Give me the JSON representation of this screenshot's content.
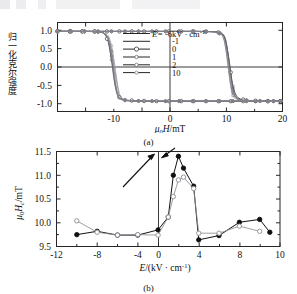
{
  "figure": {
    "panel_a_caption": "(a)",
    "panel_b_caption": "(b)"
  },
  "panel_a": {
    "ylabel_cn": "归一化克尔强度",
    "xlabel": "μ0H/mT",
    "xlabel_parts": {
      "mu": "μ",
      "zero": "0",
      "H": "H",
      "unit": "/mT"
    },
    "xticks": [
      "-10",
      "0",
      "10",
      "20"
    ],
    "yticks": [
      "1.0",
      "0.5",
      "0.0",
      "-0.5",
      "-1.0"
    ],
    "xlim": [
      -20,
      20
    ],
    "ylim": [
      -1.25,
      1.25
    ],
    "legend": {
      "title_prefix": "E=",
      "title_value": "-6kV · cm",
      "title_exp": "-1",
      "entries": [
        "-1",
        "0",
        "1",
        "2",
        "10"
      ]
    }
  },
  "panel_b": {
    "ylabel": "μ0Hc/mT",
    "ylabel_parts": {
      "mu": "μ",
      "zero": "0",
      "H": "H",
      "c": "c",
      "unit": "/mT"
    },
    "xlabel": "E/(kV · cm-1)",
    "xlabel_parts": {
      "E": "E",
      "open": "/(kV · cm",
      "exp": "-1",
      "close": ")"
    },
    "xticks": [
      "-12",
      "-8",
      "-4",
      "0",
      "4",
      "8",
      "10"
    ],
    "yticks": [
      "11.5",
      "11.0",
      "10.5",
      "10.0",
      "9.5"
    ],
    "xlim": [
      -12,
      10
    ],
    "ylim": [
      9.5,
      11.5
    ]
  },
  "chart_data": [
    {
      "type": "line",
      "panel": "a",
      "title": "",
      "xlabel": "μ0H/mT",
      "ylabel": "归一化克尔强度",
      "xlim": [
        -20,
        20
      ],
      "ylim": [
        -1.25,
        1.25
      ],
      "xticks": [
        -10,
        0,
        10,
        20
      ],
      "yticks": [
        -1.0,
        -0.5,
        0.0,
        0.5,
        1.0
      ],
      "grid": false,
      "legend_position": "inside-upper-right",
      "legend_title": "E=-6kV · cm-1",
      "series": [
        {
          "name": "-6",
          "marker": "line",
          "branch_down_x": [
            -20,
            -18,
            -16,
            -14,
            -13,
            -12,
            -11.5,
            -11,
            -10.5,
            -10,
            -9.6,
            -9.2,
            -9,
            -8.6,
            -8,
            -7,
            -5,
            -2,
            0,
            5,
            10,
            14,
            20
          ],
          "branch_down_y": [
            1.0,
            1.0,
            1.0,
            1.0,
            0.99,
            0.97,
            0.92,
            0.8,
            0.5,
            0.1,
            -0.3,
            -0.65,
            -0.8,
            -0.9,
            -0.94,
            -0.96,
            -0.96,
            -0.96,
            -0.96,
            -0.96,
            -0.96,
            -0.96,
            -0.96
          ],
          "branch_up_x": [
            20,
            16,
            14,
            13,
            12,
            11.5,
            11,
            10.6,
            10.2,
            10,
            9.6,
            9,
            8,
            6,
            3,
            0,
            -5,
            -10,
            -20
          ],
          "branch_up_y": [
            -0.96,
            -0.96,
            -0.95,
            -0.93,
            -0.88,
            -0.75,
            -0.4,
            0.0,
            0.45,
            0.7,
            0.88,
            0.95,
            0.99,
            1.0,
            1.0,
            1.0,
            1.0,
            1.0,
            1.0
          ]
        },
        {
          "name": "-1",
          "marker": "line",
          "branch_down_x": [
            -20,
            -17,
            -15,
            -13,
            -12,
            -11,
            -10.4,
            -10,
            -9.6,
            -9.2,
            -8.8,
            -8,
            -6,
            -2,
            0,
            6,
            12,
            20
          ],
          "branch_down_y": [
            1.0,
            1.0,
            1.0,
            0.99,
            0.96,
            0.88,
            0.6,
            0.25,
            -0.2,
            -0.6,
            -0.82,
            -0.92,
            -0.95,
            -0.96,
            -0.96,
            -0.96,
            -0.96,
            -0.96
          ],
          "branch_up_x": [
            20,
            16,
            13,
            12,
            11.4,
            11,
            10.6,
            10.2,
            9.8,
            9.4,
            8.6,
            6,
            2,
            0,
            -6,
            -14,
            -20
          ],
          "branch_up_y": [
            -0.96,
            -0.95,
            -0.93,
            -0.89,
            -0.78,
            -0.55,
            -0.1,
            0.35,
            0.72,
            0.9,
            0.97,
            1.0,
            1.0,
            1.0,
            1.0,
            1.0,
            1.0
          ]
        },
        {
          "name": "0",
          "marker": "open-circle",
          "branch_down_x": [
            -20,
            -16,
            -14,
            -12.5,
            -12,
            -11.5,
            -11,
            -10.6,
            -10.2,
            -9.8,
            -9.4,
            -9,
            -8,
            -6,
            -3,
            0,
            5,
            11,
            16,
            20
          ],
          "branch_down_y": [
            1.0,
            1.0,
            1.0,
            0.99,
            0.97,
            0.9,
            0.72,
            0.4,
            0.0,
            -0.45,
            -0.72,
            -0.85,
            -0.93,
            -0.95,
            -0.96,
            -0.96,
            -0.96,
            -0.96,
            -0.96,
            -0.96
          ],
          "branch_up_x": [
            20,
            17,
            14,
            12.5,
            11.8,
            11.2,
            10.8,
            10.4,
            10,
            9.6,
            9,
            8,
            5,
            0,
            -6,
            -13,
            -20
          ],
          "branch_up_y": [
            -0.96,
            -0.96,
            -0.94,
            -0.9,
            -0.8,
            -0.55,
            -0.15,
            0.3,
            0.65,
            0.87,
            0.96,
            0.99,
            1.0,
            1.0,
            1.0,
            1.0,
            1.0
          ]
        },
        {
          "name": "1",
          "marker": "line",
          "branch_down_x": [
            -20,
            -16,
            -13,
            -12,
            -11.2,
            -10.8,
            -10.4,
            -10,
            -9.6,
            -9.2,
            -8.6,
            -7,
            -4,
            0,
            6,
            13,
            20
          ],
          "branch_down_y": [
            1.0,
            1.0,
            0.99,
            0.96,
            0.85,
            0.6,
            0.2,
            -0.3,
            -0.66,
            -0.84,
            -0.92,
            -0.95,
            -0.96,
            -0.96,
            -0.96,
            -0.96,
            -0.96
          ],
          "branch_up_x": [
            20,
            16,
            13,
            12,
            11.4,
            11,
            10.6,
            10.2,
            9.8,
            9.2,
            8,
            5,
            0,
            -8,
            -20
          ],
          "branch_up_y": [
            -0.96,
            -0.95,
            -0.93,
            -0.88,
            -0.75,
            -0.45,
            0.05,
            0.5,
            0.8,
            0.94,
            0.99,
            1.0,
            1.0,
            1.0,
            1.0
          ]
        },
        {
          "name": "2",
          "marker": "line",
          "branch_down_x": [
            -20,
            -16,
            -13,
            -11.8,
            -11,
            -10.6,
            -10.2,
            -9.8,
            -9.4,
            -9,
            -8,
            -5,
            0,
            7,
            14,
            20
          ],
          "branch_down_y": [
            1.0,
            1.0,
            0.99,
            0.95,
            0.8,
            0.52,
            0.1,
            -0.4,
            -0.72,
            -0.87,
            -0.93,
            -0.96,
            -0.96,
            -0.96,
            -0.96,
            -0.96
          ],
          "branch_up_x": [
            20,
            15,
            12.5,
            11.6,
            11,
            10.6,
            10.2,
            9.8,
            9.4,
            8.6,
            7,
            3,
            0,
            -10,
            -20
          ],
          "branch_up_y": [
            -0.96,
            -0.95,
            -0.92,
            -0.85,
            -0.65,
            -0.25,
            0.25,
            0.65,
            0.87,
            0.96,
            0.99,
            1.0,
            1.0,
            1.0,
            1.0
          ]
        },
        {
          "name": "10",
          "marker": "line",
          "branch_down_x": [
            -20,
            -16,
            -13,
            -11.6,
            -10.8,
            -10.4,
            -10,
            -9.6,
            -9.2,
            -8.6,
            -7,
            -4,
            0,
            8,
            20
          ],
          "branch_down_y": [
            1.0,
            1.0,
            0.99,
            0.94,
            0.75,
            0.45,
            0.0,
            -0.5,
            -0.78,
            -0.9,
            -0.94,
            -0.96,
            -0.96,
            -0.96,
            -0.96
          ],
          "branch_up_x": [
            20,
            15,
            12,
            11.2,
            10.8,
            10.4,
            10,
            9.6,
            9,
            8,
            4,
            0,
            -10,
            -20
          ],
          "branch_up_y": [
            -0.96,
            -0.95,
            -0.91,
            -0.8,
            -0.55,
            -0.1,
            0.4,
            0.75,
            0.93,
            0.98,
            1.0,
            1.0,
            1.0,
            1.0
          ]
        }
      ]
    },
    {
      "type": "line",
      "panel": "b",
      "title": "",
      "xlabel": "E/(kV · cm-1)",
      "ylabel": "μ0Hc/mT",
      "xlim": [
        -12,
        10
      ],
      "ylim": [
        9.5,
        11.5
      ],
      "xticks": [
        -12,
        -8,
        -4,
        0,
        4,
        8,
        10
      ],
      "yticks": [
        9.5,
        10.0,
        10.5,
        11.0,
        11.5
      ],
      "grid": false,
      "legend_position": "none",
      "series": [
        {
          "name": "filled-circle",
          "marker": "filled-circle",
          "x": [
            -10,
            -8,
            -6,
            -4,
            -2,
            -1,
            -0.5,
            0,
            0.5,
            1.5,
            2,
            4,
            6,
            8,
            9
          ],
          "y": [
            9.75,
            9.82,
            9.74,
            9.74,
            9.85,
            10.12,
            11.0,
            11.4,
            11.15,
            10.77,
            9.64,
            9.73,
            10.01,
            10.07,
            9.8
          ]
        },
        {
          "name": "open-circle",
          "marker": "open-circle",
          "x": [
            -10,
            -8,
            -6,
            -4,
            -2,
            -1,
            -0.5,
            0,
            0.5,
            1.5,
            2,
            4,
            6,
            8
          ],
          "y": [
            10.04,
            9.8,
            9.74,
            9.75,
            9.74,
            10.12,
            10.55,
            10.9,
            10.96,
            10.72,
            9.78,
            9.78,
            9.93,
            9.82
          ]
        }
      ],
      "annotations": [
        {
          "type": "arrow",
          "from": [
            -1.6,
            10.85
          ],
          "to": [
            -0.35,
            11.42
          ],
          "note": "arrow pointing to peak"
        },
        {
          "type": "arrow",
          "from": [
            1.1,
            11.55
          ],
          "to": [
            0.45,
            11.3
          ],
          "note": "short arrow from top right"
        }
      ]
    }
  ]
}
